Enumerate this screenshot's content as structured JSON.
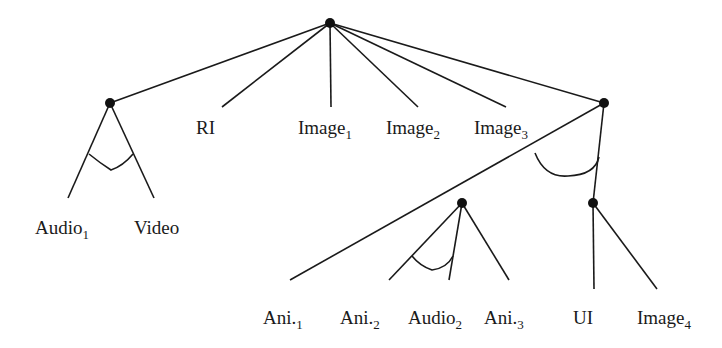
{
  "diagram": {
    "type": "and-or tree",
    "line_color": "#1a1a1a",
    "nodes": [
      {
        "id": "root",
        "x": 330,
        "y": 23
      },
      {
        "id": "left",
        "x": 110,
        "y": 103
      },
      {
        "id": "right",
        "x": 604,
        "y": 103
      },
      {
        "id": "mid",
        "x": 462,
        "y": 203
      },
      {
        "id": "uinode",
        "x": 593,
        "y": 203
      }
    ],
    "labels": {
      "audio1": {
        "base": "Audio",
        "sub": "1"
      },
      "video": {
        "base": "Video",
        "sub": ""
      },
      "ri": {
        "base": "RI",
        "sub": ""
      },
      "image1": {
        "base": "Image",
        "sub": "1"
      },
      "image2": {
        "base": "Image",
        "sub": "2"
      },
      "image3": {
        "base": "Image",
        "sub": "3"
      },
      "ani1": {
        "base": "Ani.",
        "sub": "1"
      },
      "ani2": {
        "base": "Ani.",
        "sub": "2"
      },
      "audio2": {
        "base": "Audio",
        "sub": "2"
      },
      "ani3": {
        "base": "Ani.",
        "sub": "3"
      },
      "ui": {
        "base": "UI",
        "sub": ""
      },
      "image4": {
        "base": "Image",
        "sub": "4"
      }
    }
  }
}
